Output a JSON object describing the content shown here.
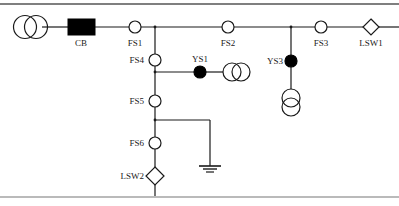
{
  "figure": {
    "type": "single-line-diagram",
    "title": "",
    "canvas": {
      "width": 399,
      "height": 206,
      "background": "#ffffff"
    },
    "colors": {
      "line": "#1a1a1a",
      "fill_open": "#ffffff",
      "fill_closed": "#000000",
      "border": "#555555"
    },
    "borders": {
      "top_rule": {
        "y": 4,
        "x1": 0,
        "x2": 399
      },
      "bottom_rule": {
        "y": 197,
        "x1": 0,
        "x2": 399
      }
    }
  },
  "buses": {
    "main_feeder": {
      "y": 27,
      "x1": 14,
      "x2": 399,
      "label": "main-feeder-bus"
    },
    "branch_vertical": {
      "x": 155,
      "y1": 27,
      "y2": 196,
      "label": "branch-vertical-bus"
    },
    "ys1_tap": {
      "y": 72,
      "x1": 155,
      "x2": 248,
      "label": "ys1-tap-line"
    },
    "ys3_tap": {
      "x": 291,
      "y1": 27,
      "y2": 107,
      "label": "ys3-tap-line"
    },
    "ground_tap": {
      "y": 120,
      "x1": 155,
      "x2": 210,
      "label": "ground-tap-line"
    },
    "ground_drop": {
      "x": 210,
      "y1": 120,
      "y2": 168,
      "label": "ground-drop-line"
    }
  },
  "devices": [
    {
      "id": "source-transformer",
      "symbol": "transformer-two-winding-horizontal",
      "label": "",
      "x": 31,
      "y": 27,
      "r": 11,
      "state": ""
    },
    {
      "id": "cb",
      "symbol": "circuit-breaker-filled-rect",
      "label": "CB",
      "x": 81,
      "y": 27,
      "w": 27,
      "h": 16,
      "state": "closed",
      "label_x": 81,
      "label_y": 45
    },
    {
      "id": "fs1",
      "symbol": "switch-open-circle",
      "label": "FS1",
      "x": 135,
      "y": 27,
      "r": 6,
      "state": "open",
      "label_x": 135,
      "label_y": 45
    },
    {
      "id": "fs2",
      "symbol": "switch-open-circle",
      "label": "FS2",
      "x": 228,
      "y": 27,
      "r": 6,
      "state": "open",
      "label_x": 228,
      "label_y": 45
    },
    {
      "id": "fs3",
      "symbol": "switch-open-circle",
      "label": "FS3",
      "x": 321,
      "y": 27,
      "r": 6,
      "state": "open",
      "label_x": 321,
      "label_y": 45
    },
    {
      "id": "lsw1",
      "symbol": "load-switch-diamond",
      "label": "LSW1",
      "x": 371,
      "y": 27,
      "r": 8,
      "state": "open",
      "label_x": 371,
      "label_y": 45
    },
    {
      "id": "fs4",
      "symbol": "switch-open-circle",
      "label": "FS4",
      "x": 155,
      "y": 60,
      "r": 6,
      "state": "open",
      "label_x": 136,
      "label_y": 63
    },
    {
      "id": "ys1",
      "symbol": "switch-closed-filled-circle",
      "label": "YS1",
      "x": 200,
      "y": 72,
      "r": 6,
      "state": "closed",
      "label_x": 200,
      "label_y": 62
    },
    {
      "id": "ys1-transformer",
      "symbol": "transformer-two-winding-horizontal",
      "label": "",
      "x": 231,
      "y": 72,
      "r": 9,
      "state": ""
    },
    {
      "id": "ys3",
      "symbol": "switch-closed-filled-circle",
      "label": "YS3",
      "x": 291,
      "y": 61,
      "r": 6,
      "state": "closed",
      "label_x": 272,
      "label_y": 64
    },
    {
      "id": "ys3-transformer",
      "symbol": "transformer-two-winding-vertical",
      "label": "",
      "x": 291,
      "y": 98,
      "r": 9,
      "state": ""
    },
    {
      "id": "fs5",
      "symbol": "switch-open-circle",
      "label": "FS5",
      "x": 155,
      "y": 101,
      "r": 6,
      "state": "open",
      "label_x": 136,
      "label_y": 104
    },
    {
      "id": "fs6",
      "symbol": "switch-open-circle",
      "label": "FS6",
      "x": 155,
      "y": 143,
      "r": 6,
      "state": "open",
      "label_x": 136,
      "label_y": 146
    },
    {
      "id": "lsw2",
      "symbol": "load-switch-diamond",
      "label": "LSW2",
      "x": 155,
      "y": 176,
      "r": 9,
      "state": "open",
      "label_x": 130,
      "label_y": 179
    },
    {
      "id": "ground",
      "symbol": "earth-ground",
      "label": "",
      "x": 210,
      "y": 168,
      "state": ""
    }
  ],
  "labels": {
    "cb": "CB",
    "fs1": "FS1",
    "fs2": "FS2",
    "fs3": "FS3",
    "fs4": "FS4",
    "fs5": "FS5",
    "fs6": "FS6",
    "ys1": "YS1",
    "ys3": "YS3",
    "lsw1": "LSW1",
    "lsw2": "LSW2"
  }
}
